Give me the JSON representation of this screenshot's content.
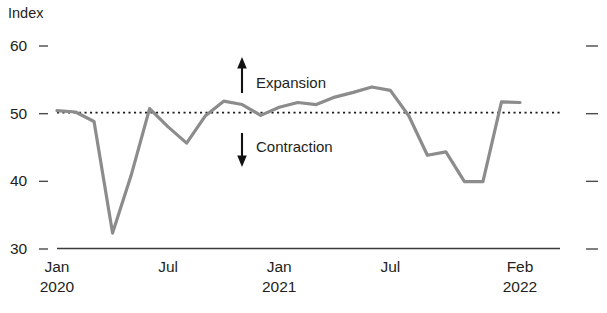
{
  "chart_data": {
    "type": "line",
    "title": "",
    "subtitle": "",
    "xlabel": "",
    "ylabel": "Index",
    "ylim": [
      30,
      60
    ],
    "yticks": [
      30,
      40,
      50,
      60
    ],
    "ytick_labels": [
      "30",
      "40",
      "50",
      "60"
    ],
    "grid": false,
    "legend": null,
    "x": [
      "Jan 2020",
      "Feb 2020",
      "Mar 2020",
      "Apr 2020",
      "May 2020",
      "Jun 2020",
      "Jul 2020",
      "Aug 2020",
      "Sep 2020",
      "Oct 2020",
      "Nov 2020",
      "Dec 2020",
      "Jan 2021",
      "Feb 2021",
      "Mar 2021",
      "Apr 2021",
      "May 2021",
      "Jun 2021",
      "Jul 2021",
      "Aug 2021",
      "Sep 2021",
      "Oct 2021",
      "Nov 2021",
      "Dec 2021",
      "Jan 2022",
      "Feb 2022"
    ],
    "values": [
      50.3,
      50.1,
      48.7,
      32.2,
      40.7,
      50.6,
      47.9,
      45.5,
      49.5,
      51.7,
      51.2,
      49.6,
      50.8,
      51.5,
      51.2,
      52.3,
      53.0,
      53.8,
      53.3,
      49.5,
      43.7,
      44.2,
      39.8,
      39.8,
      51.6,
      51.5
    ],
    "xtick_labels": [
      "Jan",
      "Jul",
      "Jan",
      "Jul",
      "Feb"
    ],
    "xtick_sublabels": [
      "2020",
      "",
      "2021",
      "",
      "2022"
    ],
    "xtick_positions": [
      "Jan 2020",
      "Jul 2020",
      "Jan 2021",
      "Jul 2021",
      "Feb 2022"
    ],
    "reference_line": {
      "value": 50,
      "style": "dotted",
      "label": ""
    },
    "annotations": [
      {
        "name": "expansion",
        "label": "Expansion",
        "arrow": "up",
        "at_value": 56
      },
      {
        "name": "contraction",
        "label": "Contraction",
        "arrow": "down",
        "at_value": 44
      }
    ],
    "colors": {
      "line": "#8c8c8c",
      "axis": "#3a3a3a",
      "reference": "#1a1a1a",
      "text": "#231f20",
      "background": "#ffffff"
    }
  }
}
